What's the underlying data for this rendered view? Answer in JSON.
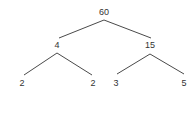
{
  "diagram": {
    "type": "factor-tree",
    "colors": {
      "text": "#333333",
      "edge": "#4a4a4a",
      "background": "#ffffff"
    },
    "nodes": [
      {
        "id": "n60",
        "label": "60",
        "x": 104,
        "y": 15
      },
      {
        "id": "n4",
        "label": "4",
        "x": 57,
        "y": 48
      },
      {
        "id": "n15",
        "label": "15",
        "x": 150,
        "y": 48
      },
      {
        "id": "n2a",
        "label": "2",
        "x": 22,
        "y": 86
      },
      {
        "id": "n2b",
        "label": "2",
        "x": 93,
        "y": 86
      },
      {
        "id": "n3",
        "label": "3",
        "x": 116,
        "y": 86
      },
      {
        "id": "n5",
        "label": "5",
        "x": 184,
        "y": 86
      }
    ],
    "edges": [
      {
        "from": "n60",
        "to": "n4",
        "x1": 104,
        "y1": 20,
        "x2": 59,
        "y2": 38
      },
      {
        "from": "n60",
        "to": "n15",
        "x1": 104,
        "y1": 20,
        "x2": 151,
        "y2": 38
      },
      {
        "from": "n4",
        "to": "n2a",
        "x1": 57,
        "y1": 53,
        "x2": 24,
        "y2": 75
      },
      {
        "from": "n4",
        "to": "n2b",
        "x1": 57,
        "y1": 53,
        "x2": 92,
        "y2": 75
      },
      {
        "from": "n15",
        "to": "n3",
        "x1": 150,
        "y1": 54,
        "x2": 117,
        "y2": 74
      },
      {
        "from": "n15",
        "to": "n5",
        "x1": 150,
        "y1": 54,
        "x2": 184,
        "y2": 74
      }
    ]
  }
}
